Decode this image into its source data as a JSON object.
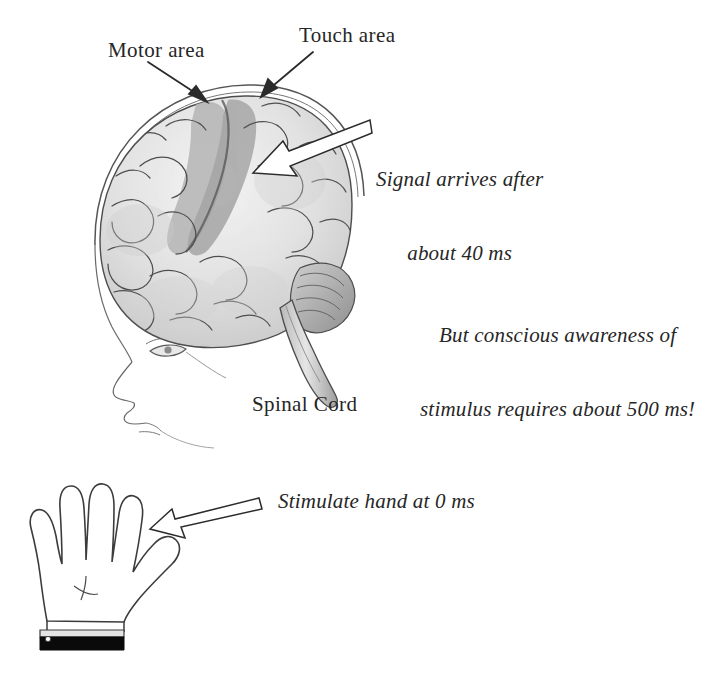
{
  "figure": {
    "title_text_present": false,
    "background_color": "#ffffff",
    "ink_color": "#262626",
    "labels": {
      "motor_area": "Motor area",
      "touch_area": "Touch area",
      "signal_arrives_line1": "Signal arrives after",
      "signal_arrives_line2": "about 40 ms",
      "conscious_line1": "But conscious awareness of",
      "conscious_line2": "stimulus requires about 500 ms!",
      "spinal_cord": "Spinal Cord",
      "stimulate_hand": "Stimulate hand at 0 ms"
    },
    "annotations": {
      "pointer_arrow_motor": "thin-arrow-icon",
      "pointer_arrow_touch": "thin-arrow-icon",
      "signal_arrow": "block-arrow-icon",
      "stimulus_arrow": "block-arrow-icon"
    },
    "illustration": {
      "head_profile": "head-profile-drawing",
      "brain": "brain-drawing",
      "motor_strip": "motor-cortex-band",
      "touch_strip": "somatosensory-cortex-band",
      "brainstem": "brainstem-spinal-cord-drawing",
      "hand": "open-hand-drawing",
      "wrist_band": "black-wrist-band"
    },
    "colors": {
      "outline": "#3a3a3a",
      "brain_light": "#efefef",
      "brain_mid": "#d8d8d8",
      "brain_shade": "#c4c4c4",
      "cortex_band": "#a8a8a8",
      "band_black": "#0a0a0a",
      "arrow_fill": "#ffffff"
    }
  }
}
